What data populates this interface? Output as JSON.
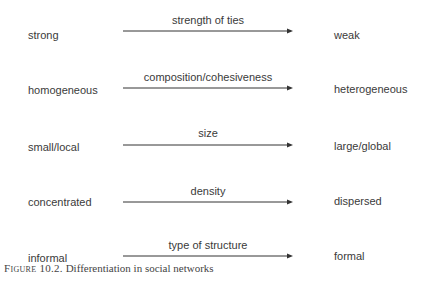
{
  "diagram": {
    "rows": [
      {
        "left": "strong",
        "label": "strength of ties",
        "right": "weak"
      },
      {
        "left": "homogeneous",
        "label": "composition/cohesiveness",
        "right": "heterogeneous"
      },
      {
        "left": "small/local",
        "label": "size",
        "right": "large/global"
      },
      {
        "left": "concentrated",
        "label": "density",
        "right": "dispersed"
      },
      {
        "left": "informal",
        "label": "type of structure",
        "right": "formal"
      }
    ],
    "arrow_icon": "arrow-right-icon"
  },
  "caption": {
    "prefix": "Figure 10.2.",
    "text": " Differentiation  in social networks"
  }
}
